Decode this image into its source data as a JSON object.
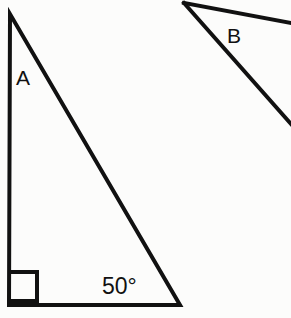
{
  "figure": {
    "background_color": "#fcfcfb",
    "stroke_color": "#111111",
    "width": 291,
    "height": 318
  },
  "triangle_a": {
    "label": "A",
    "label_x": 16,
    "label_y": 85,
    "angle_label": "50°",
    "angle_label_x": 102,
    "angle_label_y": 294,
    "right_angle_marker": "right-angle-square",
    "vertices": {
      "apex": {
        "x": 10,
        "y": 14
      },
      "bottom_left": {
        "x": 9,
        "y": 305
      },
      "bottom_right": {
        "x": 180,
        "y": 305
      }
    },
    "right_angle_square": {
      "x": 9,
      "y": 272,
      "size": 28
    },
    "stroke_width": 4
  },
  "triangle_b": {
    "label": "B",
    "label_x": 227,
    "label_y": 43,
    "vertex": {
      "x": 184,
      "y": 3
    },
    "upper_ray_end": {
      "x": 291,
      "y": 23
    },
    "lower_ray_end": {
      "x": 291,
      "y": 124
    },
    "stroke_width": 4,
    "note": "partially cropped at right edge"
  }
}
